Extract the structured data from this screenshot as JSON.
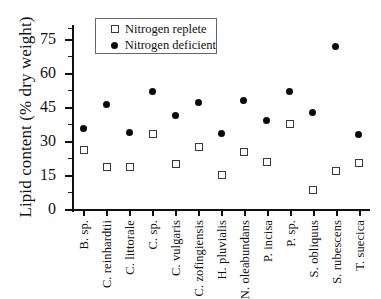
{
  "chart_data": {
    "type": "scatter",
    "title": "",
    "xlabel": "",
    "ylabel": "Lipid content (% dry weight)",
    "ylim": [
      0,
      80
    ],
    "yticks": [
      0,
      15,
      30,
      45,
      60,
      75
    ],
    "ytick_labels": [
      "0",
      "15",
      "30",
      "45",
      "60",
      "75"
    ],
    "grid": false,
    "legend_position": "top-left-inside",
    "categories": [
      "B. sp.",
      "C. reinhardtii",
      "C. littorale",
      "C. sp.",
      "C. vulgaris",
      "C. zofingiensis",
      "H. pluvialis",
      "N. oleabundans",
      "P. incisa",
      "P. sp.",
      "S. obliquus",
      "S. rubescens",
      "T. suecica"
    ],
    "series": [
      {
        "name": "Nitrogen replete",
        "marker": "open-square",
        "color": "#3a3a3a",
        "values": [
          26.5,
          18.6,
          19.0,
          33.5,
          20.0,
          27.8,
          15.3,
          25.3,
          21.1,
          38.0,
          8.7,
          16.8,
          20.5
        ]
      },
      {
        "name": "Nitrogen deficient",
        "marker": "filled-circle",
        "color": "#0b0b0b",
        "values": [
          35.8,
          46.0,
          34.0,
          52.0,
          41.5,
          47.0,
          33.2,
          48.0,
          39.0,
          52.0,
          42.5,
          72.0,
          32.8
        ]
      }
    ]
  },
  "legend": {
    "entries": [
      {
        "label": "Nitrogen replete",
        "key": "open-square"
      },
      {
        "label": "Nitrogen deficient",
        "key": "filled-circle"
      }
    ]
  }
}
